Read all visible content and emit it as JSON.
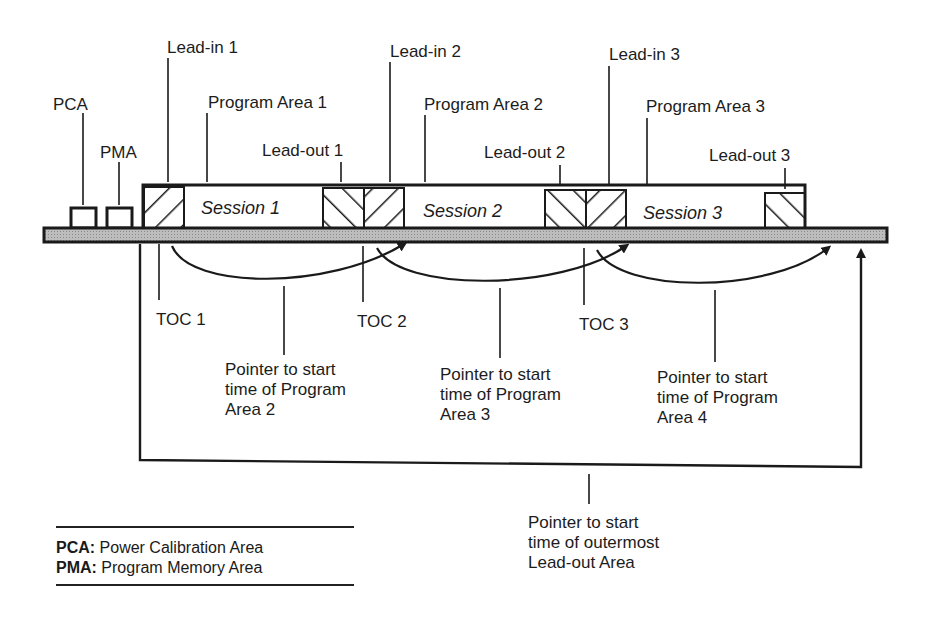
{
  "labels": {
    "pca": "PCA",
    "pma": "PMA",
    "lead_in_1": "Lead-in  1",
    "lead_in_2": "Lead-in 2",
    "lead_in_3": "Lead-in 3",
    "program_area_1": "Program  Area  1",
    "program_area_2": "Program  Area  2",
    "program_area_3": "Program  Area  3",
    "lead_out_1": "Lead-out  1",
    "lead_out_2": "Lead-out  2",
    "lead_out_3": "Lead-out  3",
    "toc_1": "TOC  1",
    "toc_2": "TOC  2",
    "toc_3": "TOC  3"
  },
  "sessions": [
    {
      "label": "Session  1"
    },
    {
      "label": "Session  2"
    },
    {
      "label": "Session  3"
    }
  ],
  "pointers": {
    "p2": [
      "Pointer to start",
      "time of Program",
      "Area 2"
    ],
    "p3": [
      "Pointer to start",
      "time of Program",
      "Area 3"
    ],
    "p4": [
      "Pointer to start",
      "time of Program",
      "Area 4"
    ],
    "outer": [
      "Pointer to start",
      "time of outermost",
      "Lead-out Area"
    ]
  },
  "legend": {
    "items": [
      {
        "abbr": "PCA:",
        "text": " Power Calibration Area"
      },
      {
        "abbr": "PMA:",
        "text": " Program Memory Area"
      }
    ]
  }
}
